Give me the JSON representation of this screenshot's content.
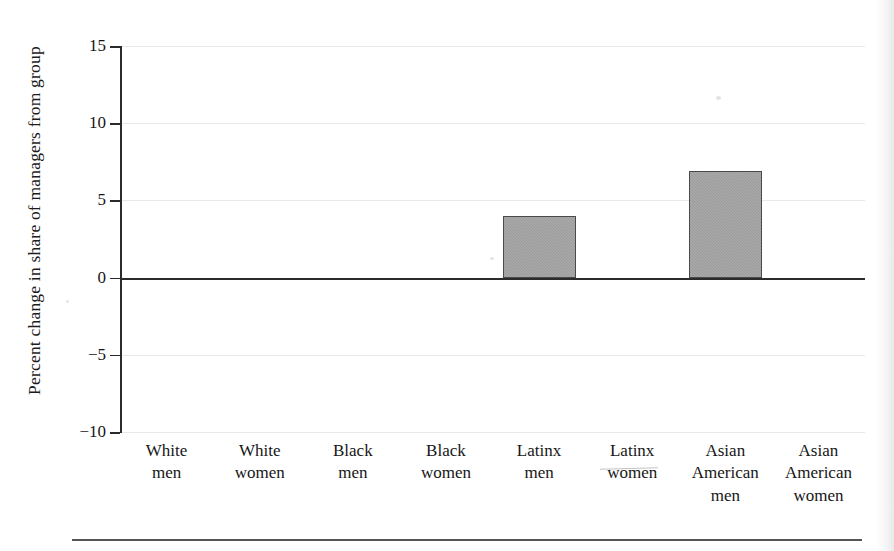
{
  "chart_data": {
    "type": "bar",
    "title": "",
    "subtitle": "",
    "xlabel": "",
    "ylabel": "Percent change in share of managers from group",
    "categories": [
      "White men",
      "White women",
      "Black men",
      "Black women",
      "Latinx men",
      "Latinx women",
      "Asian American men",
      "Asian American women"
    ],
    "category_lines": [
      [
        "White",
        "men"
      ],
      [
        "White",
        "women"
      ],
      [
        "Black",
        "men"
      ],
      [
        "Black",
        "women"
      ],
      [
        "Latinx",
        "men"
      ],
      [
        "Latinx",
        "women"
      ],
      [
        "Asian",
        "American",
        "men"
      ],
      [
        "Asian",
        "American",
        "women"
      ]
    ],
    "values": [
      0,
      0,
      0,
      0,
      4.0,
      0,
      6.9,
      0
    ],
    "ylim": [
      -10,
      15
    ],
    "ytick_values": [
      15,
      10,
      5,
      0,
      -5,
      -10
    ],
    "ytick_labels": [
      "15",
      "10",
      "5",
      "0",
      "−5",
      "−10"
    ],
    "grid": true,
    "grid_axis": "y",
    "legend": "none",
    "bar_fill_color": "#9a9a9a",
    "bar_edge_color": "#4a4a4a",
    "gridline_color": "#e9e9ea",
    "zero_line_color": "#2b2b2b",
    "axis_color": "#2b2b2b",
    "background_color": "#ffffff"
  }
}
